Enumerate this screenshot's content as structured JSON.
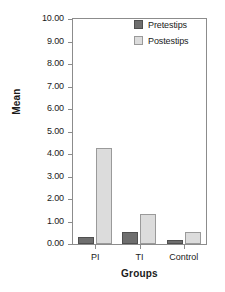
{
  "chart_data": {
    "type": "bar",
    "title": "",
    "xlabel": "Groups",
    "ylabel": "Mean",
    "categories": [
      "PI",
      "TI",
      "Control"
    ],
    "series": [
      {
        "name": "Pretestips",
        "color": "#6e6e6e",
        "values": [
          0.33,
          0.55,
          0.2
        ]
      },
      {
        "name": "Postestips",
        "color": "#dcdcdc",
        "values": [
          4.27,
          1.32,
          0.55
        ]
      }
    ],
    "ylim": [
      0,
      10
    ],
    "ytick_values": [
      0,
      1,
      2,
      3,
      4,
      5,
      6,
      7,
      8,
      9,
      10
    ],
    "ytick_labels": [
      "0.00",
      "1.00",
      "2.00",
      "3.00",
      "4.00",
      "5.00",
      "6.00",
      "7.00",
      "8.00",
      "9.00",
      "10.00"
    ],
    "grid": false,
    "legend_position": "top-right",
    "frame": true
  },
  "axes": {
    "y_title": "Mean",
    "x_title": "Groups"
  },
  "legend": {
    "entries": [
      {
        "label": "Pretestips",
        "swatch": "pre"
      },
      {
        "label": "Postestips",
        "swatch": "post"
      }
    ]
  }
}
